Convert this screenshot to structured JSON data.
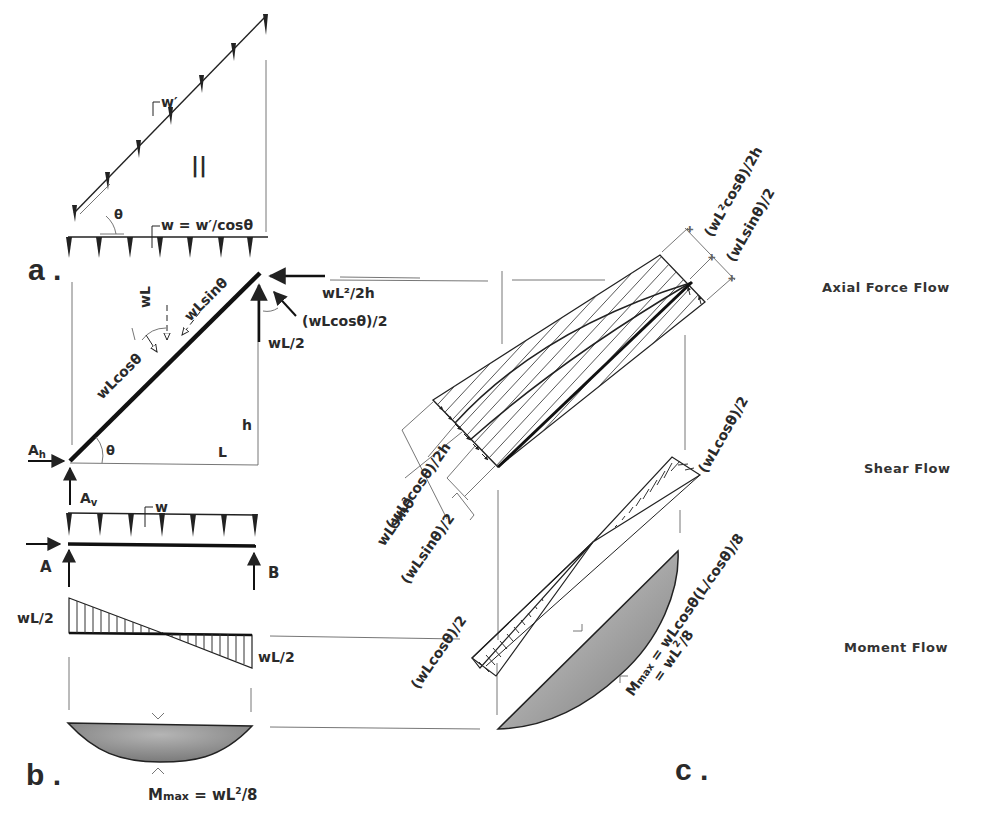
{
  "panels": {
    "a": "a .",
    "b": "b .",
    "c": "c ."
  },
  "panel_a": {
    "inclined_load": "w′",
    "equals_sign": "||",
    "theta_top": "θ",
    "horizontal_load": "w = w′/cosθ",
    "wL": "wL",
    "wLsin": "wLsinθ",
    "wLcos": "wLcosθ",
    "top_horizontal_reaction": "wL²/2h",
    "top_inclined_reaction": "(wLcosθ)/2",
    "top_vertical_reaction": "wL/2",
    "height": "h",
    "span": "L",
    "theta_base": "θ",
    "base_horizontal": "Ah",
    "base_vertical": "Av"
  },
  "panel_b": {
    "load": "w",
    "support_a": "A",
    "support_b": "B",
    "shear_left": "wL/2",
    "shear_right": "wL/2",
    "moment_max": "Mmax = wL²/8"
  },
  "panel_c": {
    "axial_top_1": "(wL²cosθ)/2h",
    "axial_top_2": "(wLsinθ)/2",
    "axial_bottom_1": "(wL²cosθ)/2h",
    "axial_bottom_2": "wLsinθ",
    "axial_bottom_3": "(wLsinθ)/2",
    "shear_top": "(wLcosθ)/2",
    "shear_bottom": "(wLcosθ)/2",
    "moment_max_line1": "Mmax = wLcosθ(L/cosθ)/8",
    "moment_max_line2": "= wL²/8"
  },
  "flow_labels": {
    "axial": "Axial Force Flow",
    "shear": "Shear Flow",
    "moment": "Moment Flow"
  }
}
